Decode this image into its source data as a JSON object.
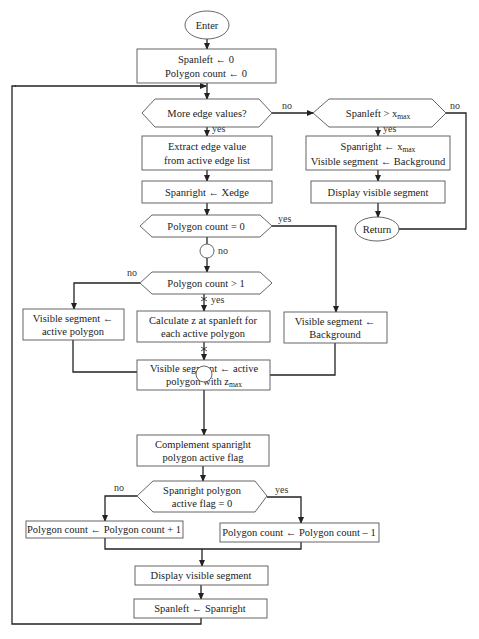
{
  "diagram": {
    "type": "flowchart",
    "nodes": {
      "enter": {
        "shape": "ellipse",
        "text": "Enter"
      },
      "init": {
        "shape": "process",
        "lines": [
          "Spanleft ← 0",
          "Polygon count ← 0"
        ]
      },
      "more_edges": {
        "shape": "decision",
        "text": "More edge values?"
      },
      "extract_edge": {
        "shape": "process",
        "lines": [
          "Extract edge value",
          "from active edge list"
        ]
      },
      "spanright_xedge": {
        "shape": "process",
        "text": "Spanright ← Xedge"
      },
      "polycount_zero": {
        "shape": "decision",
        "text": "Polygon count = 0"
      },
      "polycount_gt1": {
        "shape": "decision",
        "text": "Polygon count > 1"
      },
      "vis_active": {
        "shape": "process",
        "lines": [
          "Visible segment  ←",
          "active polygon"
        ]
      },
      "calc_z": {
        "shape": "process",
        "lines": [
          "Calculate z at spanleft for",
          "each active polygon"
        ]
      },
      "vis_background": {
        "shape": "process",
        "lines": [
          "Visible segment  ←",
          "Background"
        ]
      },
      "vis_zmax": {
        "shape": "process",
        "line1": "Visible segment ← active",
        "line2_prefix": "polygon with z",
        "line2_sub": "max"
      },
      "complement": {
        "shape": "process",
        "lines": [
          "Complement spanright",
          "polygon active flag"
        ]
      },
      "flag_zero": {
        "shape": "decision",
        "lines": [
          "Spanright polygon",
          "active flag = 0"
        ]
      },
      "count_inc": {
        "shape": "process",
        "text": "Polygon count ← Polygon count + 1"
      },
      "count_dec": {
        "shape": "process",
        "text": "Polygon count ← Polygon count – 1"
      },
      "display_seg": {
        "shape": "process",
        "text": "Display visible segment"
      },
      "spanleft_right": {
        "shape": "process",
        "text": "Spanleft ← Spanright"
      },
      "spanleft_gt_xmax": {
        "shape": "decision",
        "prefix": "Spanleft > x",
        "sub": "max"
      },
      "final_assign": {
        "shape": "process",
        "line1_prefix": "Spanright ← x",
        "line1_sub": "max",
        "line2": "Visible segment ← Background"
      },
      "final_display": {
        "shape": "process",
        "text": "Display visible segment"
      },
      "return": {
        "shape": "ellipse",
        "text": "Return"
      }
    },
    "edge_labels": {
      "more_no": "no",
      "more_yes": "yes",
      "xmax_no": "no",
      "xmax_yes": "yes",
      "zero_yes": "yes",
      "zero_no": "no",
      "gt1_no": "no",
      "gt1_yes": "yes",
      "flag_no": "no",
      "flag_yes": "yes"
    }
  }
}
